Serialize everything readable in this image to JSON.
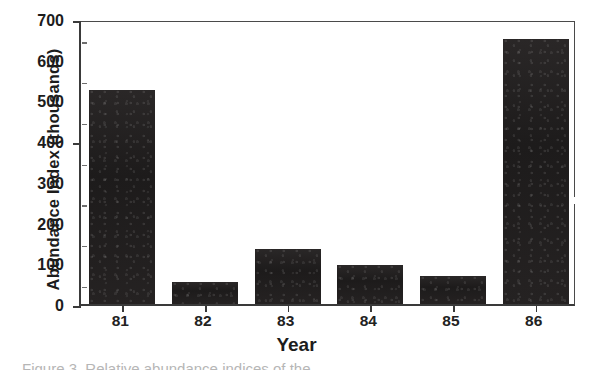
{
  "chart_data": {
    "type": "bar",
    "title": "",
    "subtitle": "",
    "categories": [
      "81",
      "82",
      "83",
      "84",
      "85",
      "86"
    ],
    "values": [
      525,
      55,
      135,
      95,
      70,
      650
    ],
    "xlabel": "Year",
    "ylabel": "Abundance Index (thousands)",
    "ylim": [
      0,
      700
    ],
    "yticks": [
      0,
      100,
      200,
      300,
      400,
      500,
      600,
      700
    ],
    "ytick_labels": [
      "0",
      "100",
      "200",
      "300",
      "400",
      "500",
      "600",
      "700"
    ],
    "y_minor_ticks": [
      50,
      150,
      250,
      350,
      450,
      550,
      650
    ],
    "grid": false,
    "legend": null,
    "bar_color": "#211f1f",
    "axis_color": "#3a3a3a",
    "series": [
      {
        "name": "Abundance Index",
        "values": [
          525,
          55,
          135,
          95,
          70,
          650
        ]
      }
    ],
    "annotations": []
  },
  "figure": {
    "caption_fragment": "Figure 3. Relative abundance indices of the"
  }
}
